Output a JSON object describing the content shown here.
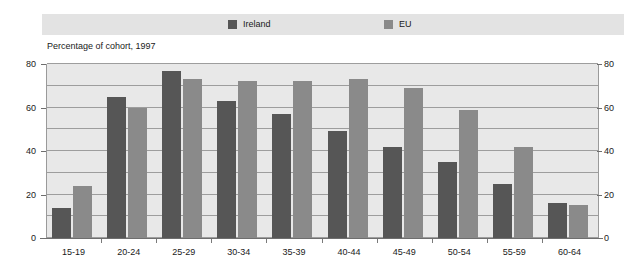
{
  "legend": {
    "items": [
      {
        "label": "Ireland",
        "color": "#565656",
        "swatch_name": "legend-swatch-ireland"
      },
      {
        "label": "EU",
        "color": "#8a8a8a",
        "swatch_name": "legend-swatch-eu"
      }
    ]
  },
  "subtitle": "Percentage of cohort, 1997",
  "axis": {
    "y_ticks": [
      "0",
      "20",
      "40",
      "60",
      "80"
    ],
    "y_ticks_right": [
      "0",
      "20",
      "40",
      "60",
      "80"
    ]
  },
  "colors": {
    "ireland": "#565656",
    "eu": "#8a8a8a",
    "plot_background": "#e8e8e8",
    "legend_band": "#e3e3e3",
    "gridline": "#9d9d9d",
    "axis": "#6e6e6e",
    "text": "#1a1a1a",
    "page_background": "#ffffff"
  },
  "chart_data": {
    "type": "bar",
    "title": "",
    "subtitle": "Percentage of cohort, 1997",
    "xlabel": "",
    "ylabel": "",
    "ylim": [
      0,
      80
    ],
    "ytick_interval": 20,
    "minor_gridline_interval": 10,
    "grid": true,
    "legend_position": "top",
    "categories": [
      "15-19",
      "20-24",
      "25-29",
      "30-34",
      "35-39",
      "40-44",
      "45-49",
      "50-54",
      "55-59",
      "60-64"
    ],
    "series": [
      {
        "name": "Ireland",
        "color": "#565656",
        "values": [
          14,
          65,
          77,
          63,
          57,
          49,
          42,
          35,
          25,
          16
        ]
      },
      {
        "name": "EU",
        "color": "#8a8a8a",
        "values": [
          24,
          60,
          73,
          72,
          72,
          73,
          69,
          59,
          42,
          15
        ]
      }
    ]
  }
}
